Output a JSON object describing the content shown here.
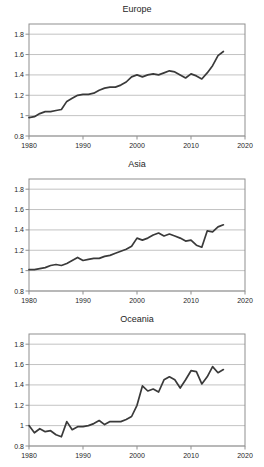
{
  "colors": {
    "background": "#ffffff",
    "line": "#3a3a3a",
    "grid": "#c3c3c3",
    "axis_border": "#8f8f8f",
    "text": "#262626"
  },
  "chart_data": [
    {
      "type": "line",
      "title": "Europe",
      "xlabel": "",
      "ylabel": "",
      "xlim": [
        1980,
        2020
      ],
      "ylim": [
        0.8,
        1.9
      ],
      "xticks": [
        1980,
        1990,
        2000,
        2010,
        2020
      ],
      "yticks": [
        0.8,
        1,
        1.2,
        1.4,
        1.6,
        1.8
      ],
      "grid": "horizontal",
      "legend": "none",
      "x": [
        1980,
        1981,
        1982,
        1983,
        1984,
        1985,
        1986,
        1987,
        1988,
        1989,
        1990,
        1991,
        1992,
        1993,
        1994,
        1995,
        1996,
        1997,
        1998,
        1999,
        2000,
        2001,
        2002,
        2003,
        2004,
        2005,
        2006,
        2007,
        2008,
        2009,
        2010,
        2011,
        2012,
        2013,
        2014,
        2015,
        2016
      ],
      "values": [
        0.98,
        0.99,
        1.02,
        1.04,
        1.04,
        1.05,
        1.06,
        1.14,
        1.17,
        1.2,
        1.21,
        1.21,
        1.22,
        1.25,
        1.27,
        1.28,
        1.28,
        1.3,
        1.33,
        1.38,
        1.4,
        1.38,
        1.4,
        1.41,
        1.4,
        1.42,
        1.44,
        1.43,
        1.4,
        1.37,
        1.41,
        1.39,
        1.36,
        1.42,
        1.49,
        1.59,
        1.63
      ]
    },
    {
      "type": "line",
      "title": "Asia",
      "xlabel": "",
      "ylabel": "",
      "xlim": [
        1980,
        2020
      ],
      "ylim": [
        0.8,
        1.9
      ],
      "xticks": [
        1980,
        1990,
        2000,
        2010,
        2020
      ],
      "yticks": [
        0.8,
        1,
        1.2,
        1.4,
        1.6,
        1.8
      ],
      "grid": "horizontal",
      "legend": "none",
      "x": [
        1980,
        1981,
        1982,
        1983,
        1984,
        1985,
        1986,
        1987,
        1988,
        1989,
        1990,
        1991,
        1992,
        1993,
        1994,
        1995,
        1996,
        1997,
        1998,
        1999,
        2000,
        2001,
        2002,
        2003,
        2004,
        2005,
        2006,
        2007,
        2008,
        2009,
        2010,
        2011,
        2012,
        2013,
        2014,
        2015,
        2016
      ],
      "values": [
        1.01,
        1.01,
        1.02,
        1.03,
        1.05,
        1.06,
        1.05,
        1.07,
        1.1,
        1.13,
        1.1,
        1.11,
        1.12,
        1.12,
        1.14,
        1.15,
        1.17,
        1.19,
        1.21,
        1.24,
        1.32,
        1.3,
        1.32,
        1.35,
        1.37,
        1.34,
        1.36,
        1.34,
        1.32,
        1.29,
        1.3,
        1.25,
        1.23,
        1.39,
        1.38,
        1.43,
        1.45
      ]
    },
    {
      "type": "line",
      "title": "Oceania",
      "xlabel": "",
      "ylabel": "",
      "xlim": [
        1980,
        2020
      ],
      "ylim": [
        0.8,
        1.9
      ],
      "xticks": [
        1980,
        1990,
        2000,
        2010,
        2020
      ],
      "yticks": [
        0.8,
        1,
        1.2,
        1.4,
        1.6,
        1.8
      ],
      "grid": "horizontal",
      "legend": "none",
      "x": [
        1980,
        1981,
        1982,
        1983,
        1984,
        1985,
        1986,
        1987,
        1988,
        1989,
        1990,
        1991,
        1992,
        1993,
        1994,
        1995,
        1996,
        1997,
        1998,
        1999,
        2000,
        2001,
        2002,
        2003,
        2004,
        2005,
        2006,
        2007,
        2008,
        2009,
        2010,
        2011,
        2012,
        2013,
        2014,
        2015,
        2016
      ],
      "values": [
        1.0,
        0.93,
        0.97,
        0.94,
        0.95,
        0.91,
        0.89,
        1.04,
        0.96,
        0.99,
        0.99,
        1.0,
        1.02,
        1.05,
        1.01,
        1.04,
        1.04,
        1.04,
        1.06,
        1.09,
        1.2,
        1.39,
        1.34,
        1.36,
        1.33,
        1.45,
        1.48,
        1.45,
        1.37,
        1.45,
        1.54,
        1.53,
        1.41,
        1.48,
        1.58,
        1.52,
        1.55
      ]
    }
  ]
}
